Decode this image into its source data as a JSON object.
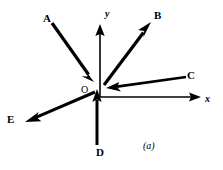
{
  "figure": {
    "caption": "(a)",
    "caption_pos": {
      "x": 143,
      "y": 141
    },
    "background_color": "#ffffff",
    "stroke_color": "#000000",
    "width": 223,
    "height": 170
  },
  "axes": {
    "origin": {
      "x": 100,
      "y": 97
    },
    "origin_label": "O",
    "origin_label_pos": {
      "x": 81,
      "y": 85
    },
    "x_axis": {
      "label": "x",
      "label_pos": {
        "x": 205,
        "y": 94
      },
      "from": {
        "x": 100,
        "y": 97
      },
      "to": {
        "x": 201,
        "y": 97
      },
      "arrow": "end"
    },
    "y_axis": {
      "label": "y",
      "label_pos": {
        "x": 105,
        "y": 9
      },
      "from": {
        "x": 100,
        "y": 97
      },
      "to": {
        "x": 100,
        "y": 24
      },
      "arrow": "end"
    }
  },
  "vectors": [
    {
      "label": "A",
      "label_pos": {
        "x": 43,
        "y": 13
      },
      "tail": {
        "x": 52,
        "y": 23
      },
      "head": {
        "x": 94,
        "y": 82
      },
      "arrow_at": "head",
      "direction": "down-right toward origin",
      "stroke_width": 3.2
    },
    {
      "label": "B",
      "label_pos": {
        "x": 154,
        "y": 10
      },
      "tail": {
        "x": 104,
        "y": 85
      },
      "head": {
        "x": 151,
        "y": 22
      },
      "arrow_at": "head",
      "direction": "up-right away from origin",
      "stroke_width": 3.2
    },
    {
      "label": "C",
      "label_pos": {
        "x": 187,
        "y": 70
      },
      "tail": {
        "x": 186,
        "y": 77
      },
      "head": {
        "x": 106,
        "y": 88
      },
      "arrow_at": "head",
      "direction": "left toward origin",
      "stroke_width": 2.6
    },
    {
      "label": "D",
      "label_pos": {
        "x": 96,
        "y": 147
      },
      "tail": {
        "x": 97,
        "y": 145
      },
      "head": {
        "x": 97,
        "y": 89
      },
      "arrow_at": "head",
      "direction": "up toward origin",
      "stroke_width": 3.0
    },
    {
      "label": "E",
      "label_pos": {
        "x": 7,
        "y": 114
      },
      "tail": {
        "x": 95,
        "y": 92
      },
      "head": {
        "x": 25,
        "y": 122
      },
      "arrow_at": "head",
      "direction": "down-left away from origin",
      "stroke_width": 3.0
    }
  ]
}
